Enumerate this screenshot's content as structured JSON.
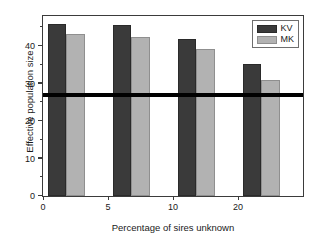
{
  "chart_data": {
    "type": "bar",
    "title": "",
    "xlabel": "Percentage of sires unknown",
    "ylabel": "Effective population size",
    "categories": [
      "0",
      "5",
      "10",
      "20"
    ],
    "xtick_labels": [
      "0",
      "5",
      "10",
      "20"
    ],
    "ytick_labels": [
      "0",
      "10",
      "20",
      "30",
      "40"
    ],
    "ytick_values": [
      0,
      10,
      20,
      30,
      40
    ],
    "yminor_values": [
      5,
      15,
      25,
      35,
      45
    ],
    "ylim": [
      0,
      48
    ],
    "xlim": [
      0,
      4
    ],
    "grid": false,
    "legend_position": "top-right",
    "series": [
      {
        "name": "KV",
        "color": "#3a3a3a",
        "values": [
          46.0,
          45.7,
          42.0,
          35.3
        ]
      },
      {
        "name": "MK",
        "color": "#b2b2b2",
        "values": [
          43.2,
          42.3,
          39.2,
          31.0
        ]
      }
    ],
    "annotations": [
      {
        "name": "reference-line",
        "type": "hline",
        "value": 27,
        "color": "#000000"
      }
    ]
  },
  "legend": {
    "items": [
      {
        "label": "KV",
        "color": "#3a3a3a"
      },
      {
        "label": "MK",
        "color": "#b2b2b2"
      }
    ]
  },
  "axes": {
    "x_title": "Percentage of sires unknown",
    "y_title": "Effective population size"
  }
}
